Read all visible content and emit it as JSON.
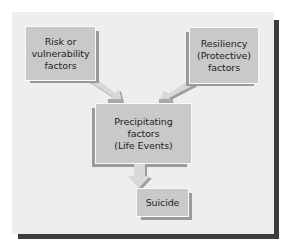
{
  "diagram": {
    "type": "flowchart",
    "nodes": [
      {
        "id": "risk",
        "label": "Risk or\nvulnerability\nfactors"
      },
      {
        "id": "resiliency",
        "label": "Resiliency\n(Protective)\nfactors"
      },
      {
        "id": "precipitating",
        "label": "Precipitating\nfactors\n(Life Events)"
      },
      {
        "id": "suicide",
        "label": "Suicide"
      }
    ],
    "edges": [
      {
        "from": "risk",
        "to": "precipitating"
      },
      {
        "from": "resiliency",
        "to": "precipitating"
      },
      {
        "from": "precipitating",
        "to": "suicide"
      }
    ],
    "colors": {
      "panel": "#eeeeee",
      "box_fill": "#c9c9c9",
      "box_shadow": "#9a9a9a",
      "arrow_fill": "#d6d6d6",
      "panel_shadow": "#3c3c3c"
    }
  }
}
